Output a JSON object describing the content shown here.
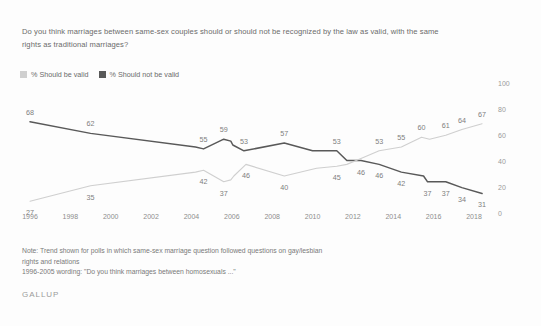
{
  "question": "Do you think marriages between same-sex couples should or should not be recognized by the law as valid, with the same rights as traditional marriages?",
  "legend": {
    "items": [
      {
        "label": "% Should be valid",
        "color": "#cfcfcf"
      },
      {
        "label": "% Should not be valid",
        "color": "#595959"
      }
    ]
  },
  "note": {
    "line1": "Note: Trend shown for polls in which same-sex marriage question followed questions on gay/lesbian",
    "line2": "rights and relations",
    "line3": "1996-2005 wording: \"Do you think marriages between homosexuals ...\""
  },
  "brand": "GALLUP",
  "chart_data": {
    "type": "line",
    "title": "Do you think marriages between same-sex couples should or should not be recognized by the law as valid, with the same rights as traditional marriages?",
    "xlabel": "",
    "ylabel": "",
    "ylim": [
      0,
      100
    ],
    "xlim": [
      1996,
      2018
    ],
    "grid": false,
    "legend_position": "top-left",
    "yticks": [
      100,
      80,
      60,
      40,
      20,
      0
    ],
    "xticks": [
      1996,
      1998,
      2000,
      2002,
      2004,
      2006,
      2008,
      2010,
      2012,
      2014,
      2016,
      2018
    ],
    "series": [
      {
        "name": "% Should not be valid",
        "color": "#595959",
        "points": [
          {
            "x": 1996,
            "y": 68,
            "label": "68",
            "label_pos": "above"
          },
          {
            "x": 1999,
            "y": 62,
            "label": "62",
            "label_pos": "above"
          },
          {
            "x": 2004.2,
            "y": 55,
            "label": "",
            "label_pos": "above"
          },
          {
            "x": 2004.6,
            "y": 54,
            "label": "55",
            "label_pos": "above"
          },
          {
            "x": 2005.6,
            "y": 59,
            "label": "59",
            "label_pos": "above"
          },
          {
            "x": 2005.95,
            "y": 58,
            "label": "",
            "label_pos": "above"
          },
          {
            "x": 2006.05,
            "y": 56,
            "label": "",
            "label_pos": "above"
          },
          {
            "x": 2006.6,
            "y": 53,
            "label": "53",
            "label_pos": "above"
          },
          {
            "x": 2008.6,
            "y": 57,
            "label": "57",
            "label_pos": "above"
          },
          {
            "x": 2010.0,
            "y": 53,
            "label": "",
            "label_pos": "above"
          },
          {
            "x": 2011.2,
            "y": 53,
            "label": "53",
            "label_pos": "above"
          },
          {
            "x": 2011.7,
            "y": 48,
            "label": "",
            "label_pos": "below"
          },
          {
            "x": 2012.4,
            "y": 48,
            "label": "46",
            "label_pos": "below"
          },
          {
            "x": 2013.3,
            "y": 46,
            "label": "46",
            "label_pos": "below"
          },
          {
            "x": 2014.4,
            "y": 42,
            "label": "42",
            "label_pos": "below"
          },
          {
            "x": 2015.5,
            "y": 40,
            "label": "",
            "label_pos": "below"
          },
          {
            "x": 2015.7,
            "y": 37,
            "label": "37",
            "label_pos": "below"
          },
          {
            "x": 2016.6,
            "y": 37,
            "label": "37",
            "label_pos": "below"
          },
          {
            "x": 2017.4,
            "y": 34,
            "label": "34",
            "label_pos": "below"
          },
          {
            "x": 2018.4,
            "y": 31,
            "label": "31",
            "label_pos": "below"
          }
        ]
      },
      {
        "name": "% Should be valid",
        "color": "#cfcfcf",
        "points": [
          {
            "x": 1996,
            "y": 27,
            "label": "27",
            "label_pos": "below"
          },
          {
            "x": 1999,
            "y": 35,
            "label": "35",
            "label_pos": "below"
          },
          {
            "x": 2004.2,
            "y": 42,
            "label": "",
            "label_pos": "below"
          },
          {
            "x": 2004.6,
            "y": 43,
            "label": "42",
            "label_pos": "below"
          },
          {
            "x": 2005.6,
            "y": 37,
            "label": "37",
            "label_pos": "below"
          },
          {
            "x": 2005.95,
            "y": 38,
            "label": "",
            "label_pos": "below"
          },
          {
            "x": 2006.1,
            "y": 40,
            "label": "",
            "label_pos": "below"
          },
          {
            "x": 2006.7,
            "y": 46,
            "label": "46",
            "label_pos": "below"
          },
          {
            "x": 2008.6,
            "y": 40,
            "label": "40",
            "label_pos": "below"
          },
          {
            "x": 2010.2,
            "y": 44,
            "label": "",
            "label_pos": "below"
          },
          {
            "x": 2011.2,
            "y": 45,
            "label": "45",
            "label_pos": "below"
          },
          {
            "x": 2011.7,
            "y": 46,
            "label": "",
            "label_pos": "below"
          },
          {
            "x": 2012.4,
            "y": 49,
            "label": "",
            "label_pos": "below"
          },
          {
            "x": 2013.3,
            "y": 53,
            "label": "53",
            "label_pos": "above"
          },
          {
            "x": 2014.4,
            "y": 55,
            "label": "55",
            "label_pos": "above"
          },
          {
            "x": 2015.4,
            "y": 60,
            "label": "60",
            "label_pos": "above"
          },
          {
            "x": 2015.8,
            "y": 59,
            "label": "",
            "label_pos": "above"
          },
          {
            "x": 2016.6,
            "y": 61,
            "label": "61",
            "label_pos": "above"
          },
          {
            "x": 2017.4,
            "y": 64,
            "label": "64",
            "label_pos": "above"
          },
          {
            "x": 2018.4,
            "y": 67,
            "label": "67",
            "label_pos": "above"
          }
        ]
      }
    ]
  }
}
